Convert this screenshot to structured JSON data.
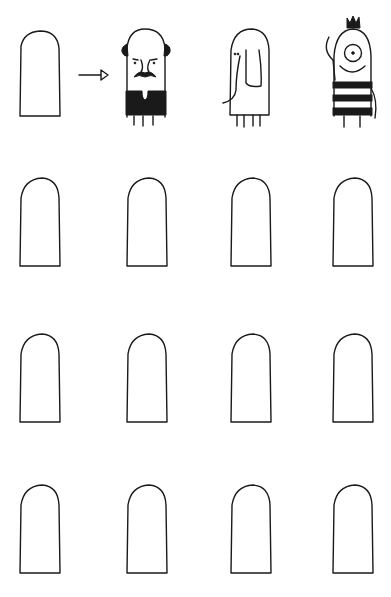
{
  "page": {
    "background": "#ffffff",
    "ink_color": "#1a1a1a"
  },
  "example_row": {
    "items": [
      {
        "kind": "blank-finger-outline"
      },
      {
        "kind": "arrow-right"
      },
      {
        "kind": "finger-puppet",
        "character": "bald-man-with-mustache"
      },
      {
        "kind": "finger-puppet",
        "character": "elephant"
      },
      {
        "kind": "finger-puppet",
        "character": "one-eyed-monster-striped-shirt"
      }
    ]
  },
  "blank_grid": {
    "rows": 3,
    "columns": 4,
    "item_kind": "blank-finger-outline"
  }
}
